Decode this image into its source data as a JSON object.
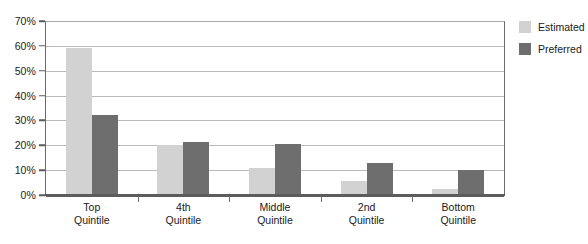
{
  "chart_data": {
    "type": "bar",
    "title": "",
    "xlabel": "",
    "ylabel": "",
    "ylim": [
      0,
      70
    ],
    "y_tick_step": 10,
    "grid": true,
    "legend_position": "right",
    "categories": [
      "Top Quintile",
      "4th Quintile",
      "Middle Quintile",
      "2nd Quintile",
      "Bottom Quintile"
    ],
    "category_lines": [
      [
        "Top",
        "Quintile"
      ],
      [
        "4th",
        "Quintile"
      ],
      [
        "Middle",
        "Quintile"
      ],
      [
        "2nd",
        "Quintile"
      ],
      [
        "Bottom",
        "Quintile"
      ]
    ],
    "y_tick_labels": [
      "70%",
      "60%",
      "50%",
      "40%",
      "30%",
      "20%",
      "10%",
      "0%"
    ],
    "y_tick_values": [
      70,
      60,
      50,
      40,
      30,
      20,
      10,
      0
    ],
    "series": [
      {
        "name": "Estimated",
        "color": "#d2d2d2",
        "values": [
          59,
          20,
          11,
          5.5,
          2.5
        ]
      },
      {
        "name": "Preferred",
        "color": "#6e6e6e",
        "values": [
          32,
          21.5,
          20.5,
          13,
          10
        ]
      }
    ]
  },
  "legend": {
    "items": [
      {
        "label": "Estimated",
        "swatch": "estimated-swatch"
      },
      {
        "label": "Preferred",
        "swatch": "preferred-swatch"
      }
    ]
  }
}
